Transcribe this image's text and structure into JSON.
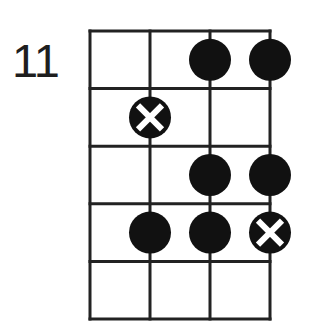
{
  "start_fret_label": "11",
  "grid": {
    "strings": 4,
    "frets": 5,
    "left": 90,
    "right": 270,
    "top": 31,
    "bottom": 319,
    "line_color": "#222222",
    "line_width": 3
  },
  "markers": [
    {
      "fret": 1,
      "string": 3,
      "type": "dot"
    },
    {
      "fret": 1,
      "string": 4,
      "type": "dot"
    },
    {
      "fret": 2,
      "string": 2,
      "type": "root"
    },
    {
      "fret": 3,
      "string": 3,
      "type": "dot"
    },
    {
      "fret": 3,
      "string": 4,
      "type": "dot"
    },
    {
      "fret": 4,
      "string": 2,
      "type": "dot"
    },
    {
      "fret": 4,
      "string": 3,
      "type": "dot"
    },
    {
      "fret": 4,
      "string": 4,
      "type": "root"
    }
  ],
  "colors": {
    "dot": "#111111",
    "x_mark": "#ffffff"
  },
  "marker_radius": 21
}
